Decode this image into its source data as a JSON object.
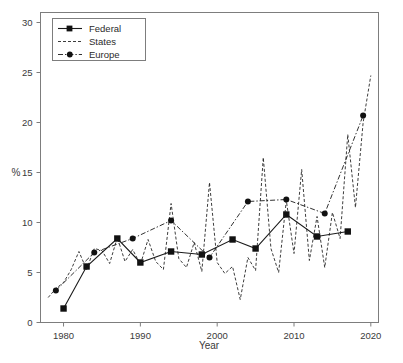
{
  "chart_data": {
    "type": "line",
    "title": "",
    "xlabel": "Year",
    "ylabel": "%",
    "xlim": [
      1977,
      2021
    ],
    "ylim": [
      0,
      31
    ],
    "grid": false,
    "legend_position": "top-left",
    "xticks": [
      1980,
      1990,
      2000,
      2010,
      2020
    ],
    "xtick_labels": [
      "1980",
      "1990",
      "2000",
      "2010",
      "2020"
    ],
    "yticks": [
      0,
      5,
      10,
      15,
      20,
      25,
      30
    ],
    "ytick_labels": [
      "0",
      "5",
      "10",
      "15",
      "20",
      "25",
      "30"
    ],
    "series": [
      {
        "name": "Federal",
        "marker": "square",
        "line_style": "solid",
        "color": "#111111",
        "x": [
          1980,
          1983,
          1987,
          1990,
          1994,
          1998,
          2002,
          2005,
          2009,
          2013,
          2017
        ],
        "values": [
          1.4,
          5.6,
          8.4,
          6.0,
          7.1,
          6.8,
          8.3,
          7.4,
          10.8,
          8.6,
          9.1
        ]
      },
      {
        "name": "States",
        "marker": "none",
        "line_style": "dashed",
        "color": "#111111",
        "x": [
          1978,
          1979,
          1980,
          1981,
          1982,
          1983,
          1984,
          1985,
          1986,
          1987,
          1988,
          1989,
          1990,
          1991,
          1992,
          1993,
          1994,
          1995,
          1996,
          1997,
          1998,
          1999,
          2000,
          2001,
          2002,
          2003,
          2004,
          2005,
          2006,
          2007,
          2008,
          2009,
          2010,
          2011,
          2012,
          2013,
          2014,
          2015,
          2016,
          2017,
          2018,
          2019,
          2020
        ],
        "values": [
          2.5,
          3.4,
          4.0,
          5.3,
          7.1,
          5.3,
          7.4,
          7.2,
          5.9,
          8.5,
          6.1,
          7.3,
          5.8,
          8.3,
          6.1,
          5.3,
          11.9,
          6.4,
          5.5,
          8.0,
          5.1,
          14.0,
          6.0,
          4.9,
          5.6,
          2.3,
          6.5,
          5.2,
          16.5,
          7.4,
          5.0,
          12.2,
          6.9,
          15.3,
          6.2,
          10.6,
          5.5,
          11.0,
          8.4,
          18.8,
          11.5,
          20.0,
          24.7
        ]
      },
      {
        "name": "Europe",
        "marker": "circle",
        "line_style": "dashdot",
        "color": "#111111",
        "x": [
          1979,
          1984,
          1989,
          1994,
          1999,
          2004,
          2009,
          2014,
          2019
        ],
        "values": [
          3.2,
          7.0,
          8.4,
          10.2,
          6.5,
          12.1,
          12.3,
          10.9,
          20.7
        ]
      }
    ]
  },
  "legend": {
    "entries": [
      {
        "label": "Federal"
      },
      {
        "label": "States"
      },
      {
        "label": "Europe"
      }
    ]
  },
  "colors": {
    "ink": "#111111",
    "axis": "#7d7d7d",
    "text": "#3a3a3a",
    "background": "#ffffff"
  }
}
